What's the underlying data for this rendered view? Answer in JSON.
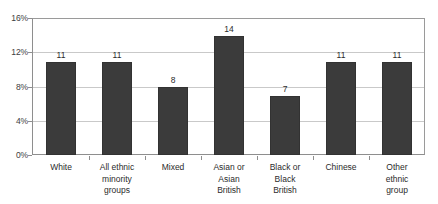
{
  "chart_data": {
    "type": "bar",
    "title": "",
    "subtitle": "",
    "xlabel": "",
    "ylabel": "",
    "categories": [
      "White",
      "All ethnic minority groups",
      "Mixed",
      "Asian or Asian British",
      "Black or Black British",
      "Chinese",
      "Other ethnic group"
    ],
    "category_lines": [
      [
        "White"
      ],
      [
        "All ethnic",
        "minority",
        "groups"
      ],
      [
        "Mixed"
      ],
      [
        "Asian or",
        "Asian",
        "British"
      ],
      [
        "Black or",
        "Black",
        "British"
      ],
      [
        "Chinese"
      ],
      [
        "Other",
        "ethnic",
        "group"
      ]
    ],
    "values": [
      11,
      11,
      8,
      14,
      7,
      11,
      11
    ],
    "value_labels": [
      "11",
      "11",
      "8",
      "14",
      "7",
      "11",
      "11"
    ],
    "ylim": [
      0,
      16
    ],
    "yticks": [
      0,
      4,
      8,
      12,
      16
    ],
    "ytick_labels": [
      "0%",
      "4%",
      "8%",
      "12%",
      "16%"
    ],
    "grid": true,
    "grid_axis": "y",
    "legend": false,
    "legend_position": "none",
    "bar_color": "#3b3b3b",
    "grid_color": "#c9c9c9",
    "axis_color": "#8e8e8e",
    "background_color": "#ffffff",
    "text_color": "#2b2b2b"
  }
}
